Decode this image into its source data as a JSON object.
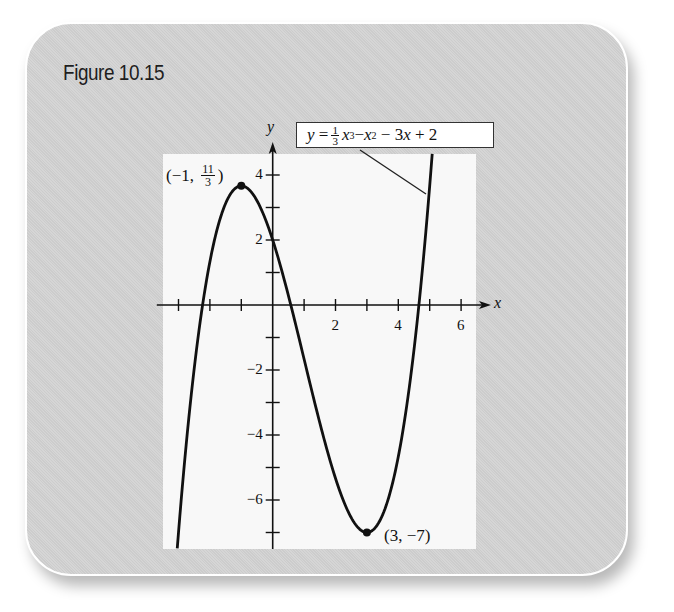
{
  "figure": {
    "title": "Figure 10.15",
    "equation": {
      "lhs": "y",
      "equals": "=",
      "frac_num": "1",
      "frac_den": "3",
      "term1_base": "x",
      "term1_exp": "3",
      "op1": "−",
      "term2_base": "x",
      "term2_exp": "2",
      "op2": "−",
      "term3": "3x",
      "op3": "+",
      "const": "2"
    },
    "axis_labels": {
      "x": "x",
      "y": "y"
    },
    "y_ticks": [
      {
        "value": 4,
        "label": "4"
      },
      {
        "value": 2,
        "label": "2"
      },
      {
        "value": -2,
        "label": "−2"
      },
      {
        "value": -4,
        "label": "−4"
      },
      {
        "value": -6,
        "label": "−6"
      }
    ],
    "x_ticks": [
      {
        "value": 2,
        "label": "2"
      },
      {
        "value": 4,
        "label": "4"
      },
      {
        "value": 6,
        "label": "6"
      }
    ],
    "points": {
      "max": {
        "open": "(",
        "x": "−1,",
        "frac_num": "11",
        "frac_den": "3",
        "close": ")"
      },
      "min": {
        "label": "(3, −7)"
      }
    }
  },
  "chart_data": {
    "type": "line",
    "title": "Figure 10.15",
    "function": "y = (1/3)x^3 - x^2 - 3x + 2",
    "xlabel": "x",
    "ylabel": "y",
    "xlim": [
      -3.5,
      6.5
    ],
    "ylim": [
      -7.5,
      4.7
    ],
    "x_tick_values": [
      -3,
      -2,
      -1,
      0,
      1,
      2,
      3,
      4,
      5,
      6
    ],
    "x_tick_labels": {
      "2": "2",
      "4": "4",
      "6": "6"
    },
    "y_tick_values": [
      -7,
      -6,
      -5,
      -4,
      -3,
      -2,
      -1,
      0,
      1,
      2,
      3,
      4
    ],
    "y_tick_labels": {
      "4": "4",
      "2": "2",
      "-2": "−2",
      "-4": "−4",
      "-6": "−6"
    },
    "grid": false,
    "series": [
      {
        "name": "y = 1/3 x^3 − x^2 − 3x + 2",
        "x": [
          -3.04,
          -2.5,
          -2,
          -1.5,
          -1,
          -0.5,
          0,
          0.5,
          1,
          1.5,
          2,
          2.5,
          3,
          3.5,
          4,
          4.5,
          5,
          5.08
        ],
        "y": [
          -7.48,
          -2.46,
          1.33,
          3.13,
          3.67,
          3.21,
          2.0,
          0.29,
          -1.67,
          -3.63,
          -5.33,
          -6.54,
          -7.0,
          -6.46,
          -4.67,
          -1.63,
          3.67,
          4.66
        ]
      }
    ],
    "annotations": [
      {
        "x": -1,
        "y": 3.667,
        "text": "(−1, 11/3)",
        "marker": "dot"
      },
      {
        "x": 3,
        "y": -7,
        "text": "(3, −7)",
        "marker": "dot"
      }
    ],
    "legend": {
      "text": "y = 1/3 x^3 − x^2 − 3x + 2",
      "position": "top-right callout box"
    },
    "colors": {
      "curve": "#111111",
      "card": "#d3d3d3",
      "plot_bg": "#f8f8f8"
    }
  }
}
